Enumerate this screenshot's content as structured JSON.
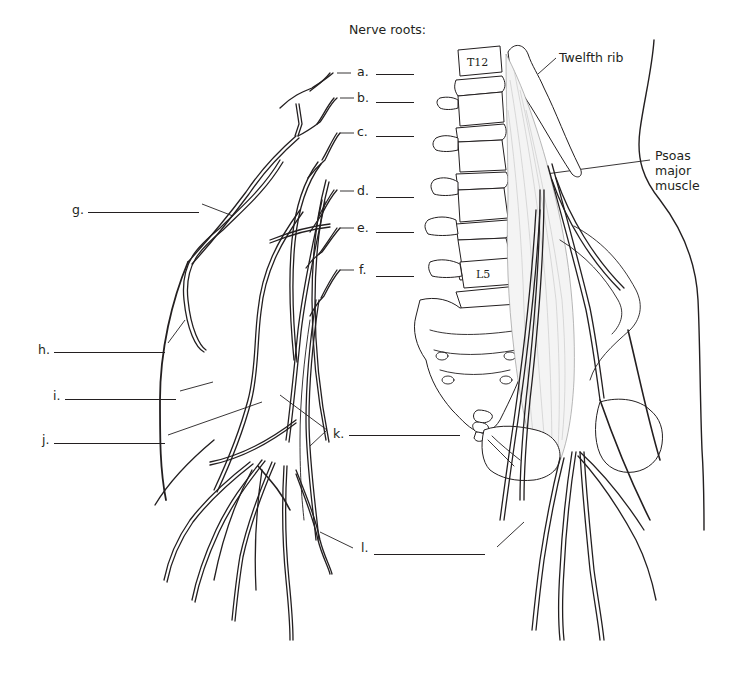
{
  "diagram": {
    "heading": "Nerve roots:",
    "root_labels": [
      {
        "letter": "a.",
        "blank": "________"
      },
      {
        "letter": "b.",
        "blank": "________"
      },
      {
        "letter": "c.",
        "blank": "________"
      },
      {
        "letter": "d.",
        "blank": "________"
      },
      {
        "letter": "e.",
        "blank": "________"
      },
      {
        "letter": "f.",
        "blank": "________"
      }
    ],
    "branch_labels": [
      {
        "letter": "g."
      },
      {
        "letter": "h."
      },
      {
        "letter": "i."
      },
      {
        "letter": "j."
      },
      {
        "letter": "k."
      },
      {
        "letter": "l."
      }
    ],
    "annotations": {
      "twelfth_rib": "Twelfth rib",
      "psoas": [
        "Psoas",
        "major",
        "muscle"
      ]
    },
    "vertebra_labels": {
      "top": "T12",
      "bottom": "L5"
    },
    "colors": {
      "line": "#231f20",
      "background": "#ffffff",
      "muscle_fill": "#f4f4f4"
    }
  }
}
